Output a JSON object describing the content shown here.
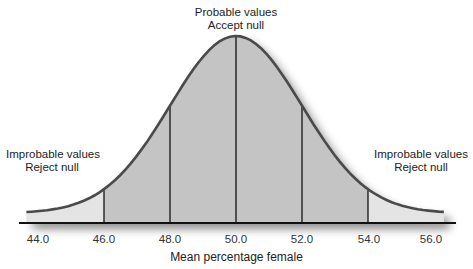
{
  "annotations": {
    "center": {
      "line1": "Probable values",
      "line2": "Accept null"
    },
    "left": {
      "line1": "Improbable values",
      "line2": "Reject null"
    },
    "right": {
      "line1": "Improbable values",
      "line2": "Reject null"
    }
  },
  "colors": {
    "curve": "#4a4a4a",
    "central_fill": "#c4c4c4",
    "tail_fill": "#e4e4e4",
    "axis": "#111111",
    "divider": "#111111"
  },
  "chart_data": {
    "type": "area",
    "title": "",
    "xlabel": "Mean percentage female",
    "ylabel": "",
    "distribution": "normal",
    "mean": 50.0,
    "sd": 2.0,
    "xlim": [
      43.5,
      56.5
    ],
    "x_ticks": [
      "44.0",
      "46.0",
      "48.0",
      "50.0",
      "52.0",
      "54.0",
      "56.0"
    ],
    "x_tick_values": [
      44.0,
      46.0,
      48.0,
      50.0,
      52.0,
      54.0,
      56.0
    ],
    "vertical_lines": [
      46.0,
      48.0,
      50.0,
      52.0,
      54.0
    ],
    "regions": [
      {
        "name": "left tail",
        "from": 43.7,
        "to": 46.0,
        "label": "Improbable values / Reject null",
        "shade": "light"
      },
      {
        "name": "center",
        "from": 46.0,
        "to": 54.0,
        "label": "Probable values / Accept null",
        "shade": "dark"
      },
      {
        "name": "right tail",
        "from": 54.0,
        "to": 56.4,
        "label": "Improbable values / Reject null",
        "shade": "light"
      }
    ],
    "grid": false,
    "legend": null
  }
}
